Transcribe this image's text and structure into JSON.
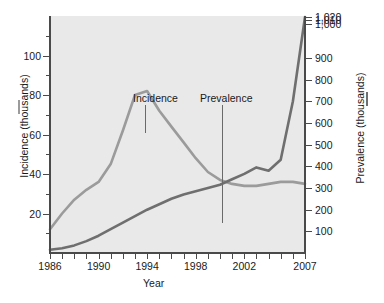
{
  "chart_data": {
    "type": "line",
    "title": "",
    "xlabel": "Year",
    "grid": false,
    "legend_position": "axis-labels",
    "x": [
      1986,
      1987,
      1988,
      1989,
      1990,
      1991,
      1992,
      1993,
      1994,
      1995,
      1996,
      1997,
      1998,
      1999,
      2000,
      2001,
      2002,
      2003,
      2004,
      2005,
      2006,
      2007
    ],
    "x_tick_labels": [
      "1986",
      "1990",
      "1994",
      "1998",
      "2002",
      "2007"
    ],
    "x_tick_label_years": [
      1986,
      1990,
      1994,
      1998,
      2002,
      2007
    ],
    "xlim": [
      1986,
      2007
    ],
    "left_axis": {
      "label": "Incidence (thousands)",
      "ticks": [
        20,
        40,
        60,
        80,
        100
      ],
      "ylim": [
        0,
        120
      ],
      "color": "#9b9b9b"
    },
    "right_axis": {
      "label": "Prevalence (thousands)",
      "ticks": [
        "100",
        "200",
        "300",
        "400",
        "500",
        "600",
        "700",
        "800",
        "900",
        "1,000",
        "1,010",
        "1,020"
      ],
      "tick_values": [
        100,
        200,
        300,
        400,
        500,
        600,
        700,
        800,
        900,
        1000,
        1010,
        1020
      ],
      "note": "scale is compressed above 900",
      "color": "#6f6f6f"
    },
    "series": [
      {
        "name": "Incidence",
        "axis": "left",
        "units": "thousands",
        "color": "#9b9b9b",
        "values": [
          12,
          20,
          27,
          32,
          36,
          45,
          62,
          80,
          82,
          72,
          64,
          56,
          48,
          41,
          37,
          35,
          34,
          34,
          35,
          36,
          36,
          35
        ]
      },
      {
        "name": "Prevalence",
        "axis": "right",
        "units": "thousands",
        "color": "#6f6f6f",
        "values": [
          15,
          22,
          35,
          55,
          80,
          110,
          140,
          170,
          200,
          225,
          250,
          270,
          285,
          300,
          315,
          340,
          365,
          395,
          380,
          430,
          700,
          1020
        ]
      }
    ],
    "annotations": [
      {
        "text": "Incidence",
        "points_to_series": "Incidence",
        "at_year": 1994
      },
      {
        "text": "Prevalence",
        "points_to_series": "Prevalence",
        "at_year": 1999
      }
    ],
    "colors": {
      "plot_background": "#e9e9e9",
      "axis": "#4a4a4a",
      "incidence": "#9b9b9b",
      "prevalence": "#6f6f6f",
      "text": "#1a1a1a"
    }
  }
}
